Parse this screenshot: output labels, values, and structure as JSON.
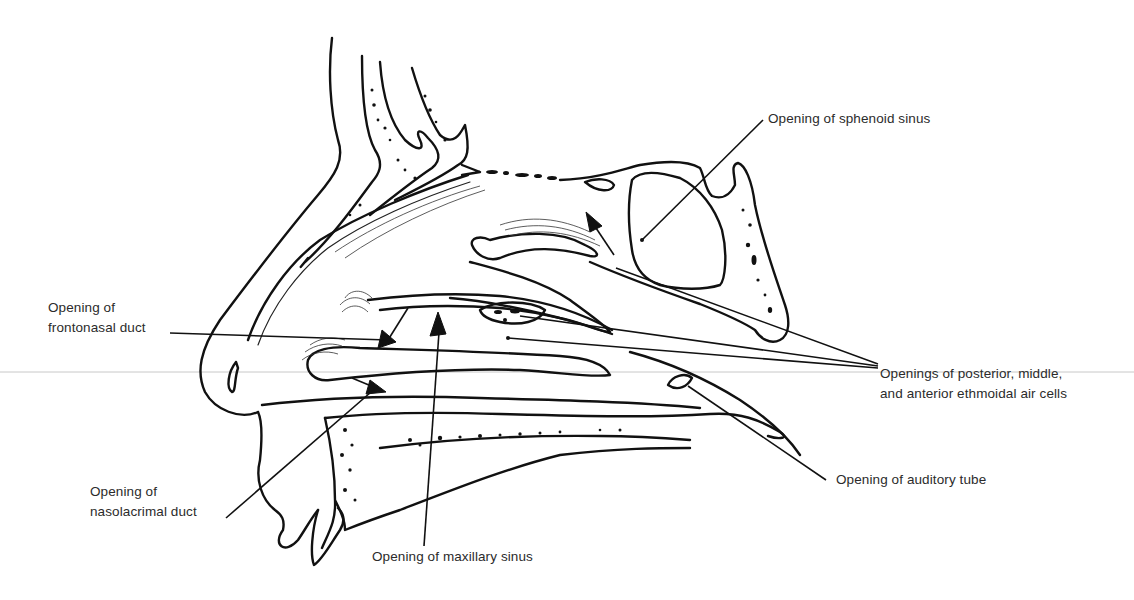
{
  "figure": {
    "labels": {
      "sphenoid": {
        "lines": [
          "Opening of sphenoid sinus"
        ]
      },
      "frontonasal": {
        "lines": [
          "Opening of",
          "frontonasal duct"
        ]
      },
      "ethmoidal": {
        "lines": [
          "Openings of posterior, middle,",
          "and anterior ethmoidal air cells"
        ]
      },
      "nasolacrimal": {
        "lines": [
          "Opening of",
          "nasolacrimal duct"
        ]
      },
      "maxillary": {
        "lines": [
          "Opening of maxillary sinus"
        ]
      },
      "auditory": {
        "lines": [
          "Opening of auditory tube"
        ]
      }
    },
    "colors": {
      "ink": "#111111",
      "text": "#2b2b2b",
      "background": "#ffffff"
    }
  }
}
